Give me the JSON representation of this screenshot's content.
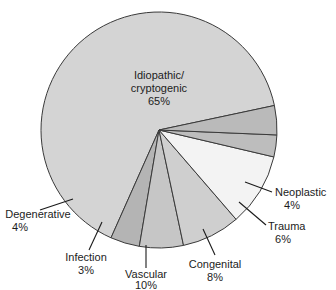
{
  "chart_data": {
    "type": "pie",
    "title": "",
    "subtitle": "",
    "xlabel": "",
    "ylabel": "",
    "legend_position": "none",
    "grid": false,
    "categories": [
      "Idiopathic/cryptogenic",
      "Neoplastic",
      "Trauma",
      "Congenital",
      "Vascular",
      "Infection",
      "Degenerative"
    ],
    "values": [
      65,
      4,
      6,
      8,
      10,
      3,
      4
    ],
    "units": "%",
    "slices": [
      {
        "name": "Idiopathic/cryptogenic",
        "label_line1": "Idiopathic/",
        "label_line2": "cryptogenic",
        "value": 65,
        "value_label": "65%",
        "color": "#d4d4d4",
        "label_placement": "inside"
      },
      {
        "name": "Neoplastic",
        "label_line1": "Neoplastic",
        "label_line2": "",
        "value": 4,
        "value_label": "4%",
        "color": "#b4b4b4",
        "label_placement": "outside-right"
      },
      {
        "name": "Trauma",
        "label_line1": "Trauma",
        "label_line2": "",
        "value": 6,
        "value_label": "6%",
        "color": "#c6c6c6",
        "label_placement": "outside-right"
      },
      {
        "name": "Congenital",
        "label_line1": "Congenital",
        "label_line2": "",
        "value": 8,
        "value_label": "8%",
        "color": "#cfcfcf",
        "label_placement": "outside-bottom"
      },
      {
        "name": "Vascular",
        "label_line1": "Vascular",
        "label_line2": "",
        "value": 10,
        "value_label": "10%",
        "color": "#f3f3f3",
        "label_placement": "outside-bottom"
      },
      {
        "name": "Infection",
        "label_line1": "Infection",
        "label_line2": "",
        "value": 3,
        "value_label": "3%",
        "color": "#bdbdbd",
        "label_placement": "outside-bottom"
      },
      {
        "name": "Degenerative",
        "label_line1": "Degenerative",
        "label_line2": "",
        "value": 4,
        "value_label": "4%",
        "color": "#bababa",
        "label_placement": "outside-left"
      }
    ],
    "colors": {
      "outline": "#3a3a3a",
      "leader": "#1a1a1a",
      "text": "#1c1c1c",
      "background": "#ffffff"
    }
  },
  "labels": {
    "idiopathic_line1": "Idiopathic/",
    "idiopathic_line2": "cryptogenic",
    "idiopathic_value": "65%",
    "neoplastic_name": "Neoplastic",
    "neoplastic_value": "4%",
    "trauma_name": "Trauma",
    "trauma_value": "6%",
    "congenital_name": "Congenital",
    "congenital_value": "8%",
    "vascular_name": "Vascular",
    "vascular_value": "10%",
    "infection_name": "Infection",
    "infection_value": "3%",
    "degenerative_name": "Degenerative",
    "degenerative_value": "4%"
  }
}
